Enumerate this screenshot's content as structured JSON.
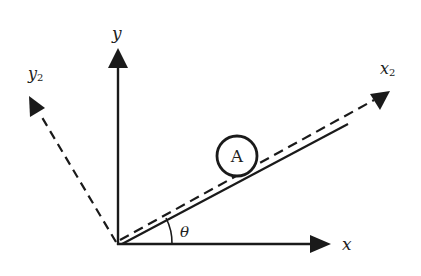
{
  "diagram": {
    "type": "coordinate-axes-incline",
    "origin": [
      118,
      244
    ],
    "axes": {
      "x": {
        "label": "x",
        "tip": [
          330,
          244
        ],
        "style": "solid"
      },
      "y": {
        "label": "y",
        "tip": [
          118,
          48
        ],
        "style": "solid"
      },
      "x2": {
        "label": "x",
        "subscript": "2",
        "tip": [
          390,
          91
        ],
        "style": "dashed"
      },
      "y2": {
        "label": "y",
        "subscript": "2",
        "tip": [
          29,
          96
        ],
        "style": "dashed"
      }
    },
    "incline": {
      "start": [
        122,
        244
      ],
      "end": [
        348,
        124
      ],
      "style": "solid"
    },
    "body": {
      "label": "A",
      "center": [
        237,
        156
      ],
      "radius": 20
    },
    "angle": {
      "label": "θ",
      "between": [
        "x",
        "x2"
      ]
    },
    "colors": {
      "stroke": "#1a1a1a",
      "background": "#ffffff"
    }
  }
}
